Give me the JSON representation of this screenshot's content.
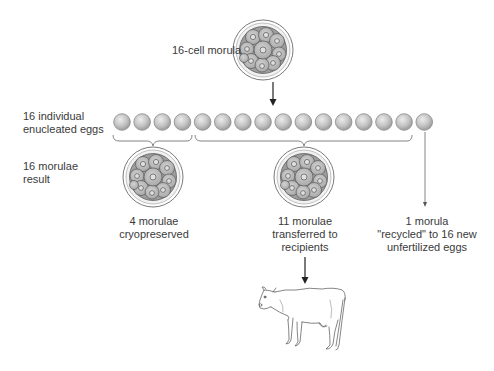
{
  "diagram": {
    "top_label": "16-cell morula",
    "row_label_eggs": [
      "16 individual",
      "enucleated eggs"
    ],
    "row_label_result": [
      "16 morulae",
      "result"
    ],
    "egg_count": 16,
    "groups": [
      {
        "id": "cryo",
        "eggs": 4,
        "label": [
          "4 morulae",
          "cryopreserved"
        ]
      },
      {
        "id": "transfer",
        "eggs": 11,
        "label": [
          "11 morulae",
          "transferred to",
          "recipients"
        ]
      },
      {
        "id": "recycle",
        "eggs": 1,
        "label": [
          "1 morula",
          "\"recycled\" to 16 new",
          "unfertilized eggs"
        ]
      }
    ],
    "colors": {
      "line": "#555555",
      "egg_fill": "#c8c8c8",
      "egg_stroke": "#8a8a8a",
      "cell_fill": "#b5b5b5",
      "zona": "#e8e8e8"
    }
  }
}
